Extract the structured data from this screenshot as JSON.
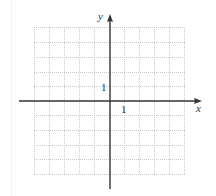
{
  "diagram": {
    "type": "coordinate-plane",
    "axes": {
      "x_label": "x",
      "y_label": "y",
      "x_range": [
        -5,
        5
      ],
      "y_range": [
        -5,
        5
      ]
    },
    "ticks": {
      "x_unit_label": "1",
      "y_unit_label": "1"
    },
    "grid": {
      "cells_x": 10,
      "cells_y": 10,
      "line_style": "dotted",
      "line_color": "#c8c8c8",
      "axis_color": "#333333"
    }
  }
}
